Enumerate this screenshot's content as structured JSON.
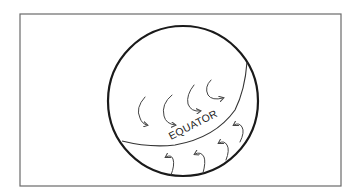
{
  "diagram": {
    "title": "",
    "labels": {
      "equator": "EQUATOR"
    },
    "elements": {
      "frame": "rectangle-border",
      "globe": "circle",
      "equator_line": "curved-line",
      "arrows_northern_hemisphere": 4,
      "arrows_southern_hemisphere": 4
    },
    "colors": {
      "background": "#ffffff",
      "frame_stroke": "#6a6a6a",
      "globe_stroke": "#1a1a1a",
      "line_stroke": "#333333"
    }
  }
}
